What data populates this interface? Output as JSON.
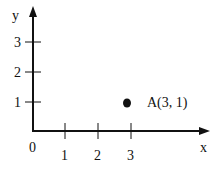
{
  "figure": {
    "type": "coordinate-plane",
    "axes": {
      "x_label": "x",
      "y_label": "y",
      "origin_label": "0",
      "x_ticks": [
        {
          "value": 1,
          "label": "1",
          "px": 65
        },
        {
          "value": 2,
          "label": "2",
          "px": 98
        },
        {
          "value": 3,
          "label": "3",
          "px": 131
        }
      ],
      "y_ticks": [
        {
          "value": 1,
          "label": "1",
          "py": 102
        },
        {
          "value": 2,
          "label": "2",
          "py": 72
        },
        {
          "value": 3,
          "label": "3",
          "py": 42
        }
      ]
    },
    "points": [
      {
        "name": "A",
        "x": 3,
        "y": 1,
        "label": "A(3, 1)"
      }
    ],
    "colors": {
      "stroke": "#111111",
      "background": "#ffffff"
    }
  }
}
